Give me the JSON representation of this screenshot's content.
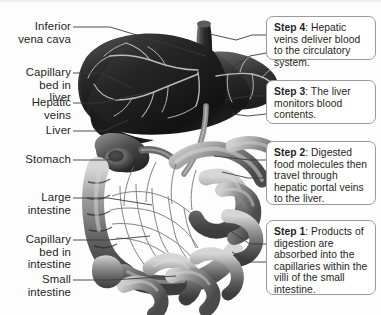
{
  "figure": {
    "background_color": "#fdfdfd",
    "text_color": "#231f20",
    "leader_line_color": "#3a3a3a",
    "callout_border_color": "#9a9a9a",
    "callout_fill_color": "#ffffff"
  },
  "labels": [
    {
      "id": "inferior-vena-cava",
      "text": "Inferior\nvena cava"
    },
    {
      "id": "capillary-bed-liver",
      "text": "Capillary\nbed in\nliver"
    },
    {
      "id": "hepatic-veins",
      "text": "Hepatic\nveins"
    },
    {
      "id": "liver",
      "text": "Liver"
    },
    {
      "id": "stomach",
      "text": "Stomach"
    },
    {
      "id": "large-intestine",
      "text": "Large\nintestine"
    },
    {
      "id": "capillary-bed-intestine",
      "text": "Capillary\nbed in\nintestine"
    },
    {
      "id": "small-intestine",
      "text": "Small\nintestine"
    }
  ],
  "callouts": [
    {
      "id": "step-4",
      "step": "Step 4",
      "body": ": Hepatic veins deliver blood to the circulatory system."
    },
    {
      "id": "step-3",
      "step": "Step 3",
      "body": ": The liver monitors blood contents."
    },
    {
      "id": "step-2",
      "step": "Step 2",
      "body": ": Digested food molecules then travel through hepatic portal veins to the liver."
    },
    {
      "id": "step-1",
      "step": "Step 1",
      "body": ": Products of digestion are absorbed into the capillaries within the villi of the small intestine."
    }
  ]
}
